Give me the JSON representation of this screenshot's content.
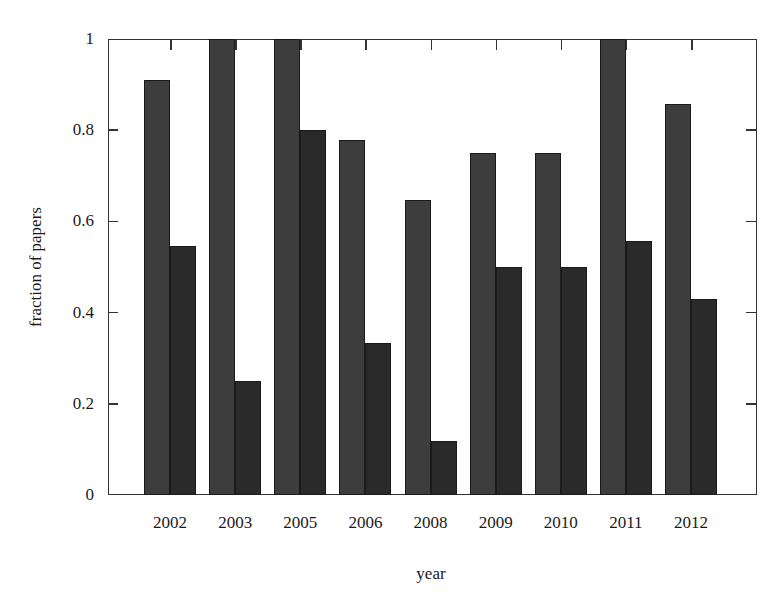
{
  "chart_data": {
    "type": "bar",
    "title": "",
    "xlabel": "year",
    "ylabel": "fraction of papers",
    "ylim": [
      0,
      1
    ],
    "yticks": [
      "0",
      "0.2",
      "0.4",
      "0.6",
      "0.8",
      "1"
    ],
    "categories": [
      "2002",
      "2003",
      "2005",
      "2006",
      "2008",
      "2009",
      "2010",
      "2011",
      "2012"
    ],
    "series": [
      {
        "name": "series 1",
        "color": "#3d3d3d",
        "values": [
          0.91,
          1.0,
          1.0,
          0.778,
          0.647,
          0.75,
          0.75,
          1.0,
          0.857
        ]
      },
      {
        "name": "series 2",
        "color": "#2a2a2a",
        "values": [
          0.545,
          0.25,
          0.8,
          0.333,
          0.118,
          0.5,
          0.5,
          0.556,
          0.429
        ]
      }
    ],
    "grid": false,
    "legend_position": "top (cut off)"
  }
}
